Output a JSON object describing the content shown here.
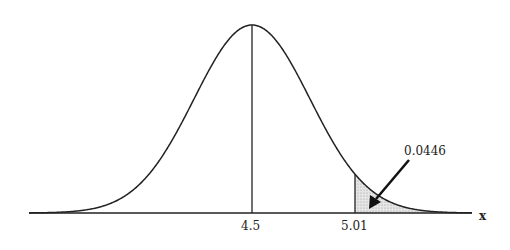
{
  "chart_data": {
    "type": "area",
    "title": "",
    "xlabel": "x",
    "ylabel": "",
    "mean": 4.5,
    "critical_value": 5.01,
    "tail_area": 0.0446,
    "tick_labels": [
      "4.5",
      "5.01"
    ],
    "annotations": [
      {
        "text": "0.0446",
        "points_to": "shaded right tail beyond 5.01"
      }
    ],
    "shaded_region": {
      "from": 5.01,
      "to": "infinity",
      "fill": "#d9d9d9"
    }
  },
  "labels": {
    "mean": "4.5",
    "critical": "5.01",
    "area": "0.0446",
    "axis": "x"
  }
}
